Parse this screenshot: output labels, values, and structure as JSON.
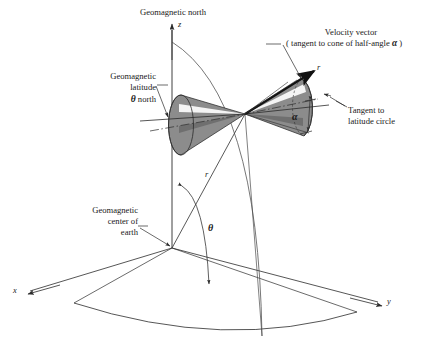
{
  "figure": {
    "title_top": "Geomagnetic north",
    "background_color": "#ffffff",
    "line_color": "#2b2b2b",
    "cone_fill": "#8c8c8c",
    "cone_fill_dark": "#6f6f6f",
    "cone_highlight": "#f2f2f2"
  },
  "labels": {
    "geomagnetic_north": "Geomagnetic north",
    "velocity_vector_line1": "Velocity vector",
    "velocity_vector_line2_pre": "( tangent to cone of  half-angle ",
    "velocity_vector_line2_sym": "α",
    "velocity_vector_line2_post": " )",
    "geomagnetic_latitude_line1": "Geomagnetic",
    "geomagnetic_latitude_line2": "latitude",
    "geomagnetic_latitude_line3_sym": "θ",
    "geomagnetic_latitude_line3_text": "north",
    "tangent_latitude_line1": "Tangent to",
    "tangent_latitude_line2": "latitude circle",
    "geomagnetic_center_line1": "Geomagnetic",
    "geomagnetic_center_line2": "center of",
    "geomagnetic_center_line3": "earth"
  },
  "symbols": {
    "axis_z": "z",
    "axis_x": "x",
    "axis_y": "y",
    "radius_upper": "r",
    "radius_lower": "r",
    "angle_alpha": "α",
    "angle_theta": "θ"
  },
  "geometry": {
    "origin": {
      "x": 172,
      "y": 248
    },
    "particle_point": {
      "x": 245,
      "y": 114
    },
    "z_axis_tip": {
      "x": 172,
      "y": 22
    },
    "x_axis_tip": {
      "x": 24,
      "y": 293
    },
    "y_axis_tip": {
      "x": 384,
      "y": 303
    },
    "cone_half_angle_label_pos": {
      "x": 297,
      "y": 118
    },
    "polar_angle_label_pos": {
      "x": 211,
      "y": 228
    }
  }
}
